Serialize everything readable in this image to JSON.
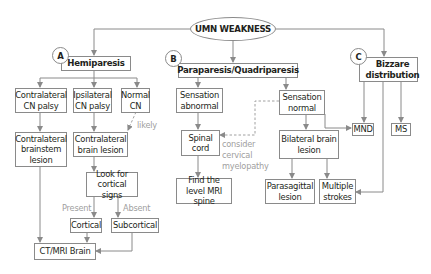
{
  "diagram": {
    "root": "UMN WEAKNESS",
    "branches": {
      "a": {
        "marker": "A",
        "title": "Hemiparesis"
      },
      "b": {
        "marker": "B",
        "title": "Paraparesis/Quadriparesis"
      },
      "c": {
        "marker": "C",
        "title": "Bizzare distribution"
      }
    },
    "nodes": {
      "contra_cn_palsy": "Contralateral CN palsy",
      "ipsi_cn_palsy": "Ipsilateral CN palsy",
      "normal_cn": "Normal CN",
      "contra_brainstem": "Contralateral brainstem lesion",
      "contra_brain": "Contralateral brain lesion",
      "look_cortical": "Look for cortical signs",
      "cortical": "Cortical",
      "subcortical": "Subcortical",
      "ct_mri_brain": "CT/MRI Brain",
      "sensation_abnormal": "Sensation abnormal",
      "sensation_normal": "Sensation normal",
      "spinal_cord": "Spinal cord",
      "find_level": "Find the level MRI spine",
      "bilateral_brain": "Bilateral brain lesion",
      "parasagittal": "Parasagittal lesion",
      "multiple_strokes": "Multiple strokes",
      "mnd": "MND",
      "ms": "MS"
    },
    "edge_labels": {
      "likely": "likely",
      "present": "Present",
      "absent": "Absent",
      "consider_1": "consider",
      "consider_2": "cervical",
      "consider_3": "myelopathy"
    },
    "colors": {
      "line": "#8a8a8a",
      "text": "#231f20",
      "annotation": "#a0a0a0"
    }
  }
}
